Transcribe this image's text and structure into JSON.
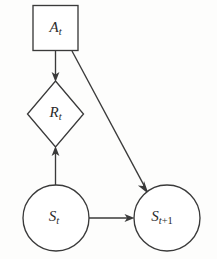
{
  "diagram": {
    "background_color": "#fdfdfc",
    "stroke_color": "#3a3a3a",
    "fill_color": "#ffffff",
    "nodes": [
      {
        "id": "action",
        "shape": "square",
        "label_base": "A",
        "label_sub": "t",
        "label_full": "A_t",
        "cx": 55.5,
        "cy": 28,
        "half_width": 23,
        "half_height": 23
      },
      {
        "id": "reward",
        "shape": "diamond",
        "label_base": "R",
        "label_sub": "t",
        "label_full": "R_t",
        "cx": 55.5,
        "cy": 114,
        "half_width": 28,
        "half_height": 33
      },
      {
        "id": "state-t",
        "shape": "circle",
        "label_base": "S",
        "label_sub": "t",
        "label_full": "S_t",
        "cx": 56,
        "cy": 218,
        "radius": 33
      },
      {
        "id": "state-t-plus-1",
        "shape": "circle",
        "label_base": "S",
        "label_sub": "t",
        "label_sub_op": "+1",
        "label_full": "S_t+1",
        "cx": 167,
        "cy": 218,
        "radius": 33
      }
    ],
    "edges": [
      {
        "id": "action-to-reward",
        "from": "action",
        "to": "reward",
        "direction": "down",
        "x1": 55.5,
        "y1": 51,
        "x2": 55.5,
        "y2": 81
      },
      {
        "id": "action-to-next-state",
        "from": "action",
        "to": "state-t-plus-1",
        "direction": "diagonal-down-right",
        "x1": 72,
        "y1": 51,
        "x2": 148,
        "y2": 193
      },
      {
        "id": "state-to-reward",
        "from": "state-t",
        "to": "reward",
        "direction": "up",
        "x1": 55.5,
        "y1": 185,
        "x2": 55.5,
        "y2": 147
      },
      {
        "id": "state-to-next-state",
        "from": "state-t",
        "to": "state-t-plus-1",
        "direction": "right",
        "x1": 89,
        "y1": 218,
        "x2": 134,
        "y2": 218
      }
    ]
  }
}
